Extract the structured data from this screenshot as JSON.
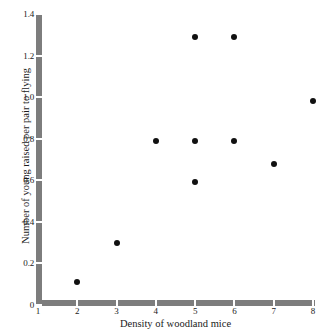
{
  "chart_data": {
    "type": "scatter",
    "title": "",
    "xlabel": "Density of woodland mice",
    "ylabel": "Number of young raised per pair to flying",
    "xlim": [
      1,
      8
    ],
    "ylim": [
      0,
      1.4
    ],
    "grid": false,
    "legend": null,
    "x_ticks": [
      "1",
      "2",
      "3",
      "4",
      "5",
      "6",
      "7",
      "8"
    ],
    "x_tick_values": [
      1,
      2,
      3,
      4,
      5,
      6,
      7,
      8
    ],
    "y_ticks": [
      "0",
      "0.2",
      "0.4",
      "0.6",
      "0.8",
      "1.0",
      "1.2",
      "1.4"
    ],
    "y_tick_values": [
      0,
      0.2,
      0.4,
      0.6,
      0.8,
      1.0,
      1.2,
      1.4
    ],
    "marker": "filled-circle",
    "marker_color": "#111111",
    "axis_color": "#7d7d7d",
    "background_color": "#ffffff",
    "points": [
      {
        "x": 2,
        "y": 0.11
      },
      {
        "x": 3,
        "y": 0.3
      },
      {
        "x": 4,
        "y": 0.79
      },
      {
        "x": 5,
        "y": 1.29
      },
      {
        "x": 5,
        "y": 0.79
      },
      {
        "x": 5,
        "y": 0.59
      },
      {
        "x": 6,
        "y": 1.29
      },
      {
        "x": 6,
        "y": 0.79
      },
      {
        "x": 7,
        "y": 0.68
      },
      {
        "x": 8,
        "y": 0.98
      }
    ]
  }
}
